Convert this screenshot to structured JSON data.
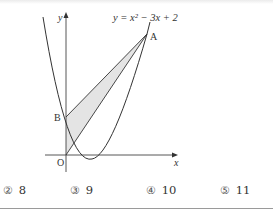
{
  "figure": {
    "equation": "y = x² − 3x + 2",
    "axis_labels": {
      "x": "x",
      "y": "y"
    },
    "points": {
      "O": {
        "label": "O"
      },
      "A": {
        "label": "A"
      },
      "B": {
        "label": "B"
      }
    },
    "shaded_region": "triangle OAB",
    "colors": {
      "curve": "#333333",
      "axis": "#444444",
      "shade": "#e4e4e4"
    }
  },
  "choices": [
    {
      "num": "②",
      "value": "8"
    },
    {
      "num": "③",
      "value": "9"
    },
    {
      "num": "④",
      "value": "10"
    },
    {
      "num": "⑤",
      "value": "11"
    }
  ]
}
